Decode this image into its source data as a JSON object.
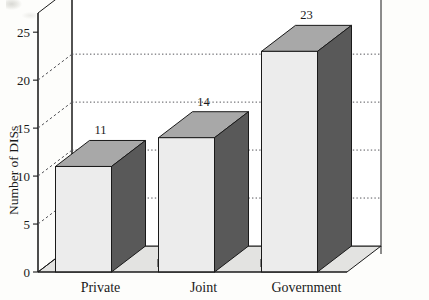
{
  "chart_data": {
    "type": "bar",
    "title": "",
    "subtitle": "",
    "xlabel": "",
    "ylabel": "Number of DISs",
    "categories": [
      "Private",
      "Joint",
      "Government"
    ],
    "values": [
      11,
      14,
      23
    ],
    "data_labels": [
      "11",
      "14",
      "23"
    ],
    "ylim": [
      0,
      27
    ],
    "yticks": [
      0,
      5,
      10,
      15,
      20,
      25
    ],
    "ytick_labels": [
      "0",
      "5",
      "10",
      "15",
      "20",
      "25"
    ],
    "gridlines": [
      5,
      10,
      15,
      20
    ],
    "grid": "horizontal-dotted",
    "legend": "none",
    "style": "3d-bars",
    "colors": {
      "bar_front": "#ececec",
      "bar_side": "#595959",
      "bar_top": "#a8a8a8",
      "floor": "#e3e3e1",
      "wall": "#ffffff",
      "ink": "#1a1a1a",
      "grid": "#55555a"
    }
  },
  "axes": {
    "y_title": "Number of DISs",
    "y_ticks": [
      {
        "value": 25,
        "label": "25"
      },
      {
        "value": 20,
        "label": "20"
      },
      {
        "value": 15,
        "label": "15"
      },
      {
        "value": 10,
        "label": "10"
      },
      {
        "value": 5,
        "label": "5"
      },
      {
        "value": 0,
        "label": "0"
      }
    ]
  },
  "bars": [
    {
      "category": "Private",
      "value": 11,
      "label": "11"
    },
    {
      "category": "Joint",
      "value": 14,
      "label": "14"
    },
    {
      "category": "Government",
      "value": 23,
      "label": "23"
    }
  ]
}
